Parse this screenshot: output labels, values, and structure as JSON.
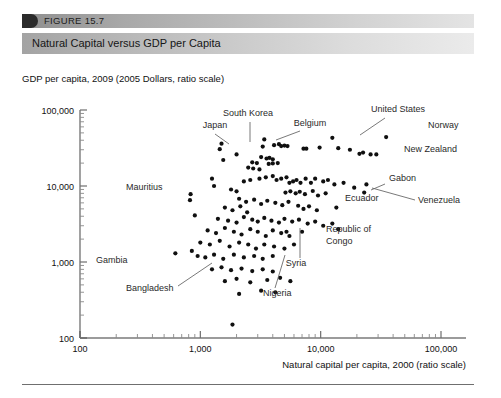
{
  "figure": {
    "number": "FIGURE 15.7",
    "title": "Natural Capital versus GDP per Capita"
  },
  "chart_data": {
    "type": "scatter",
    "title": "Natural Capital versus GDP per Capita",
    "ylabel": "GDP per capita, 2009 (2005 Dollars, ratio scale)",
    "xlabel": "Natural capital per capita, 2000 (ratio scale)",
    "xscale": "log",
    "yscale": "log",
    "xlim": [
      100,
      100000
    ],
    "ylim": [
      100,
      100000
    ],
    "grid": false,
    "legend": null,
    "xticks": [
      "100",
      "1,000",
      "10,000",
      "100,000"
    ],
    "yticks": [
      "100",
      "1,000",
      "10,000",
      "100,000"
    ],
    "annotations": [
      {
        "label": "Japan",
        "x": 1500,
        "y": 36000
      },
      {
        "label": "South Korea",
        "x": 2000,
        "y": 26000
      },
      {
        "label": "Belgium",
        "x": 3400,
        "y": 41000
      },
      {
        "label": "United States",
        "x": 12500,
        "y": 43000
      },
      {
        "label": "Norway",
        "x": 35000,
        "y": 44000
      },
      {
        "label": "New Zealand",
        "x": 29000,
        "y": 26000
      },
      {
        "label": "Mauritius",
        "x": 830,
        "y": 7800
      },
      {
        "label": "Gabon",
        "x": 24000,
        "y": 10500
      },
      {
        "label": "Venezuela",
        "x": 23000,
        "y": 8200
      },
      {
        "label": "Ecuador",
        "x": 13500,
        "y": 5200
      },
      {
        "label": "Republic of Congo",
        "x": 14000,
        "y": 2700
      },
      {
        "label": "Syria",
        "x": 13800,
        "y": 2300
      },
      {
        "label": "Gambia",
        "x": 620,
        "y": 1300
      },
      {
        "label": "Bangladesh",
        "x": 850,
        "y": 1400
      },
      {
        "label": "Nigeria",
        "x": 5200,
        "y": 2500
      }
    ],
    "points": [
      [
        1500,
        36000
      ],
      [
        2000,
        26000
      ],
      [
        3400,
        41000
      ],
      [
        12500,
        43000
      ],
      [
        35000,
        44000
      ],
      [
        29000,
        26000
      ],
      [
        24000,
        10500
      ],
      [
        23000,
        8200
      ],
      [
        13500,
        5200
      ],
      [
        14000,
        2700
      ],
      [
        620,
        1300
      ],
      [
        850,
        1400
      ],
      [
        5200,
        2500
      ],
      [
        830,
        7800
      ],
      [
        820,
        6500
      ],
      [
        900,
        4100
      ],
      [
        1450,
        30500
      ],
      [
        1550,
        22000
      ],
      [
        3300,
        33000
      ],
      [
        4100,
        34500
      ],
      [
        4500,
        35500
      ],
      [
        4700,
        33500
      ],
      [
        5000,
        34000
      ],
      [
        5300,
        33500
      ],
      [
        7200,
        31000
      ],
      [
        7600,
        31000
      ],
      [
        9800,
        32000
      ],
      [
        14000,
        31500
      ],
      [
        17500,
        30000
      ],
      [
        21000,
        26500
      ],
      [
        22500,
        27500
      ],
      [
        26000,
        26000
      ],
      [
        3200,
        24000
      ],
      [
        3550,
        23000
      ],
      [
        3750,
        23500
      ],
      [
        4000,
        22500
      ],
      [
        2700,
        20500
      ],
      [
        2950,
        20000
      ],
      [
        3700,
        19500
      ],
      [
        4000,
        19800
      ],
      [
        4400,
        20000
      ],
      [
        2500,
        17500
      ],
      [
        2750,
        17000
      ],
      [
        3100,
        16500
      ],
      [
        1250,
        12500
      ],
      [
        1300,
        10000
      ],
      [
        1800,
        9000
      ],
      [
        2000,
        8500
      ],
      [
        2300,
        11500
      ],
      [
        2600,
        12000
      ],
      [
        3100,
        12500
      ],
      [
        3500,
        13000
      ],
      [
        4000,
        13500
      ],
      [
        4300,
        12000
      ],
      [
        4700,
        12500
      ],
      [
        5200,
        13000
      ],
      [
        5500,
        11000
      ],
      [
        5900,
        11500
      ],
      [
        6300,
        12000
      ],
      [
        6800,
        11000
      ],
      [
        7500,
        12500
      ],
      [
        8300,
        11000
      ],
      [
        9000,
        12500
      ],
      [
        10500,
        11500
      ],
      [
        11500,
        12000
      ],
      [
        13000,
        10500
      ],
      [
        15500,
        11000
      ],
      [
        19000,
        9500
      ],
      [
        5100,
        8200
      ],
      [
        5600,
        8500
      ],
      [
        6200,
        8000
      ],
      [
        6700,
        8400
      ],
      [
        7400,
        7800
      ],
      [
        8600,
        8600
      ],
      [
        9500,
        7500
      ],
      [
        11000,
        8000
      ],
      [
        2100,
        6800
      ],
      [
        2400,
        6200
      ],
      [
        2800,
        6600
      ],
      [
        3200,
        5800
      ],
      [
        3600,
        6400
      ],
      [
        4200,
        6000
      ],
      [
        4800,
        5600
      ],
      [
        5400,
        6200
      ],
      [
        1600,
        5200
      ],
      [
        1850,
        4800
      ],
      [
        2150,
        5400
      ],
      [
        2450,
        4500
      ],
      [
        6500,
        5500
      ],
      [
        7200,
        5000
      ],
      [
        8000,
        5400
      ],
      [
        9300,
        4800
      ],
      [
        1400,
        3700
      ],
      [
        1700,
        3500
      ],
      [
        2000,
        3300
      ],
      [
        2300,
        3900
      ],
      [
        2700,
        3600
      ],
      [
        3000,
        3400
      ],
      [
        3400,
        3800
      ],
      [
        3900,
        3500
      ],
      [
        4500,
        3300
      ],
      [
        5000,
        3700
      ],
      [
        5800,
        3400
      ],
      [
        6600,
        3600
      ],
      [
        7800,
        3200
      ],
      [
        9000,
        3400
      ],
      [
        10500,
        3000
      ],
      [
        12500,
        3200
      ],
      [
        1150,
        2600
      ],
      [
        1350,
        2400
      ],
      [
        1600,
        2800
      ],
      [
        1900,
        2500
      ],
      [
        2200,
        2300
      ],
      [
        2600,
        2700
      ],
      [
        3000,
        2500
      ],
      [
        3500,
        2200
      ],
      [
        4000,
        2600
      ],
      [
        4700,
        2400
      ],
      [
        5500,
        2200
      ],
      [
        7000,
        2500
      ],
      [
        1000,
        1800
      ],
      [
        1200,
        1700
      ],
      [
        1450,
        1900
      ],
      [
        1750,
        1600
      ],
      [
        2100,
        1800
      ],
      [
        2500,
        1700
      ],
      [
        2900,
        1500
      ],
      [
        3400,
        1700
      ],
      [
        4100,
        1600
      ],
      [
        5000,
        1500
      ],
      [
        6000,
        1700
      ],
      [
        950,
        1200
      ],
      [
        1100,
        1150
      ],
      [
        1300,
        1250
      ],
      [
        1550,
        1100
      ],
      [
        1900,
        1250
      ],
      [
        2300,
        1150
      ],
      [
        2800,
        1200
      ],
      [
        3300,
        1100
      ],
      [
        4000,
        1200
      ],
      [
        1250,
        800
      ],
      [
        1500,
        850
      ],
      [
        1800,
        780
      ],
      [
        2200,
        820
      ],
      [
        2700,
        760
      ],
      [
        3300,
        800
      ],
      [
        4000,
        750
      ],
      [
        1600,
        560
      ],
      [
        2000,
        600
      ],
      [
        2600,
        540
      ],
      [
        3600,
        580
      ],
      [
        4600,
        620
      ],
      [
        5600,
        560
      ],
      [
        2100,
        380
      ],
      [
        3200,
        420
      ],
      [
        4200,
        400
      ],
      [
        1850,
        150
      ]
    ]
  }
}
